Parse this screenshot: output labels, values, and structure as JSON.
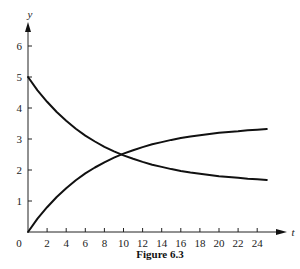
{
  "chart_data": {
    "type": "line",
    "title": "",
    "caption": "Figure 6.3",
    "xlabel": "t",
    "ylabel": "y",
    "xlim": [
      0,
      25
    ],
    "ylim": [
      0,
      6.6
    ],
    "x_ticks": [
      2,
      4,
      6,
      8,
      10,
      12,
      14,
      16,
      18,
      20,
      22,
      24
    ],
    "x_tick_labels": [
      "2",
      "4",
      "6",
      "8",
      "10",
      "12",
      "14",
      "16",
      "18",
      "20",
      "22",
      "24"
    ],
    "y_ticks": [
      1,
      2,
      3,
      4,
      5,
      6
    ],
    "y_tick_labels": [
      "1",
      "2",
      "3",
      "4",
      "5",
      "6"
    ],
    "origin_label": "0",
    "grid": false,
    "legend": null,
    "x": [
      0,
      1,
      2,
      3,
      4,
      5,
      6,
      7,
      8,
      9,
      10,
      11,
      12,
      13,
      14,
      15,
      16,
      17,
      18,
      19,
      20,
      21,
      22,
      23,
      24,
      25
    ],
    "series": [
      {
        "name": "decreasing curve",
        "values": [
          5.0,
          4.57,
          4.2,
          3.87,
          3.59,
          3.33,
          3.11,
          2.92,
          2.75,
          2.6,
          2.47,
          2.36,
          2.26,
          2.17,
          2.1,
          2.03,
          1.97,
          1.92,
          1.88,
          1.84,
          1.8,
          1.77,
          1.75,
          1.72,
          1.7,
          1.68
        ]
      },
      {
        "name": "increasing curve",
        "values": [
          0.0,
          0.43,
          0.8,
          1.13,
          1.41,
          1.67,
          1.89,
          2.08,
          2.25,
          2.4,
          2.53,
          2.64,
          2.74,
          2.83,
          2.9,
          2.97,
          3.03,
          3.08,
          3.12,
          3.16,
          3.2,
          3.23,
          3.25,
          3.28,
          3.3,
          3.32
        ]
      }
    ],
    "annotations": [
      "curves intersect near t ≈ 9.6, y ≈ 2.5"
    ]
  }
}
